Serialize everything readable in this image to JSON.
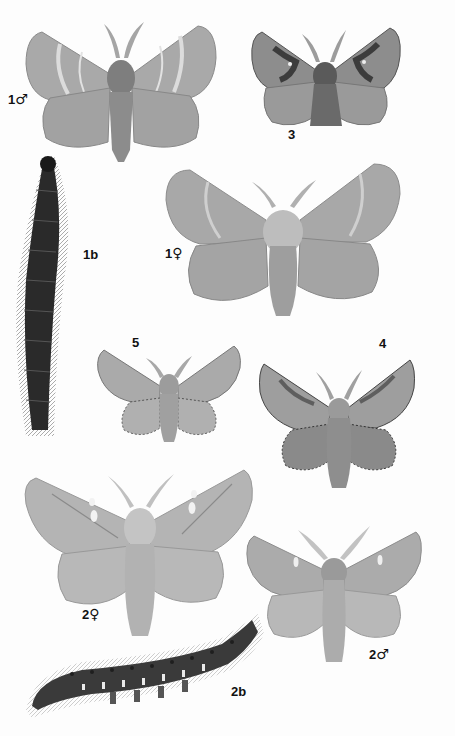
{
  "plate": {
    "background": "#fdfdfd",
    "specimens": [
      {
        "id": "1-male",
        "number": "1",
        "sex_symbol": "♂",
        "kind": "moth",
        "label_pos": [
          8,
          92
        ]
      },
      {
        "id": "3",
        "number": "3",
        "sex_symbol": "",
        "kind": "moth",
        "label_pos": [
          288,
          128
        ]
      },
      {
        "id": "1b",
        "number": "1b",
        "sex_symbol": "",
        "kind": "caterpillar",
        "label_pos": [
          83,
          248
        ]
      },
      {
        "id": "1-female",
        "number": "1",
        "sex_symbol": "♀",
        "kind": "moth",
        "label_pos": [
          165,
          246
        ]
      },
      {
        "id": "5",
        "number": "5",
        "sex_symbol": "",
        "kind": "moth",
        "label_pos": [
          132,
          336
        ]
      },
      {
        "id": "4",
        "number": "4",
        "sex_symbol": "",
        "kind": "moth",
        "label_pos": [
          379,
          337
        ]
      },
      {
        "id": "2-female",
        "number": "2",
        "sex_symbol": "♀",
        "kind": "moth",
        "label_pos": [
          82,
          607
        ]
      },
      {
        "id": "2-male",
        "number": "2",
        "sex_symbol": "♂",
        "kind": "moth",
        "label_pos": [
          369,
          647
        ]
      },
      {
        "id": "2b",
        "number": "2b",
        "sex_symbol": "",
        "kind": "caterpillar",
        "label_pos": [
          231,
          685
        ]
      }
    ]
  },
  "labels": {
    "l1m_num": "1",
    "l1m_sym": "♂",
    "l3_num": "3",
    "l1b_num": "1b",
    "l1f_num": "1",
    "l1f_sym": "♀",
    "l5_num": "5",
    "l4_num": "4",
    "l2f_num": "2",
    "l2f_sym": "♀",
    "l2m_num": "2",
    "l2m_sym": "♂",
    "l2b_num": "2b"
  },
  "colors": {
    "wing_light": "#b9b9b9",
    "wing_mid": "#9a9a9a",
    "wing_dark": "#6e6e6e",
    "body": "#8c8c8c",
    "caterpillar_dark": "#2a2a2a"
  }
}
